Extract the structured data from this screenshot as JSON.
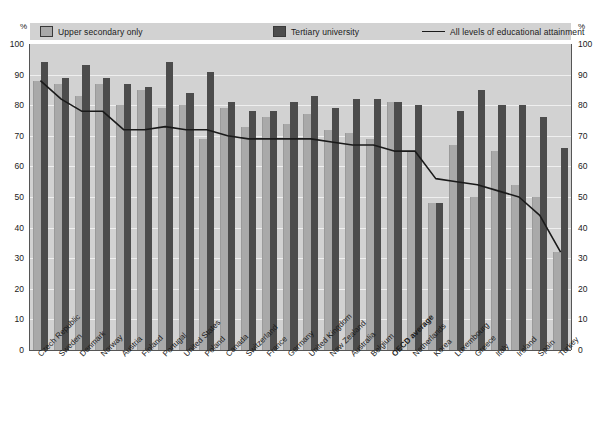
{
  "axis": {
    "unit_label_left": "%",
    "unit_label_right": "%",
    "yticks": [
      "100",
      "90",
      "80",
      "70",
      "60",
      "50",
      "40",
      "30",
      "20",
      "10",
      "0"
    ]
  },
  "legend": {
    "items": [
      {
        "key": "upper_secondary",
        "label": "Upper secondary only",
        "marker": "square-light-icon",
        "color": "#a9a9a9"
      },
      {
        "key": "tertiary",
        "label": "Tertiary university",
        "marker": "square-dark-icon",
        "color": "#4c4c4c"
      },
      {
        "key": "all_levels",
        "label": "All levels of educational attainment",
        "marker": "line-icon",
        "color": "#1a1a1a"
      }
    ]
  },
  "chart_data": {
    "type": "bar",
    "title": "",
    "subtitle": "",
    "xlabel": "",
    "ylabel": "%",
    "ylim": [
      0,
      100
    ],
    "grid": true,
    "legend_position": "top",
    "categories": [
      "Czech Republic",
      "Sweden",
      "Denmark",
      "Norway",
      "Austria",
      "Finland",
      "Portugal",
      "United States",
      "Poland",
      "Canada",
      "Switzerland",
      "France",
      "Germany",
      "United Kingdom",
      "New Zealand",
      "Australia",
      "Belgium",
      "OECD average",
      "Netherlands",
      "Korea",
      "Luxembourg",
      "Greece",
      "Italy",
      "Ireland",
      "Spain",
      "Turkey"
    ],
    "emphasized_category": "OECD average",
    "series": [
      {
        "name": "Upper secondary only",
        "color": "#a9a9a9",
        "values": [
          88,
          87,
          83,
          87,
          80,
          85,
          79,
          80,
          69,
          79,
          73,
          76,
          74,
          77,
          72,
          71,
          69,
          81,
          65,
          48,
          67,
          50,
          65,
          54,
          50,
          32
        ]
      },
      {
        "name": "Tertiary university",
        "color": "#4c4c4c",
        "values": [
          94,
          89,
          93,
          89,
          87,
          86,
          94,
          84,
          91,
          81,
          78,
          78,
          81,
          83,
          79,
          82,
          82,
          81,
          80,
          48,
          78,
          85,
          80,
          80,
          76,
          66
        ]
      }
    ],
    "line_series": {
      "name": "All levels of educational attainment",
      "color": "#1a1a1a",
      "values": [
        88,
        82,
        78,
        78,
        72,
        72,
        73,
        72,
        72,
        70,
        69,
        69,
        69,
        69,
        68,
        67,
        67,
        65,
        65,
        56,
        55,
        54,
        52,
        50,
        44,
        32
      ]
    }
  }
}
